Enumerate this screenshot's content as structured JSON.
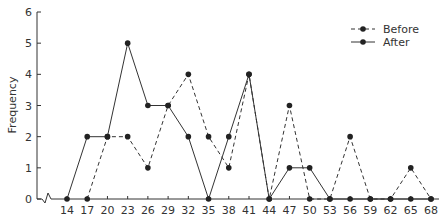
{
  "chart_data": {
    "type": "line",
    "title": "",
    "xlabel": "",
    "ylabel": "Frequency",
    "ylim": [
      0,
      6
    ],
    "yticks": [
      0,
      1,
      2,
      3,
      4,
      5,
      6
    ],
    "x": [
      14,
      17,
      20,
      23,
      26,
      29,
      32,
      35,
      38,
      41,
      44,
      47,
      50,
      53,
      56,
      59,
      62,
      65,
      68
    ],
    "axis_break": true,
    "grid": false,
    "legend_position": "top-right",
    "series": [
      {
        "name": "Before",
        "style": "dashed",
        "x": [
          17,
          20,
          23,
          26,
          29,
          32,
          35,
          38,
          41,
          44,
          47,
          50,
          53,
          56,
          59,
          62,
          65,
          68
        ],
        "values": [
          0,
          2,
          2,
          1,
          3,
          4,
          2,
          1,
          4,
          0,
          3,
          0,
          0,
          2,
          0,
          0,
          1,
          0
        ]
      },
      {
        "name": "After",
        "style": "solid",
        "x": [
          14,
          17,
          20,
          23,
          26,
          29,
          32,
          35,
          38,
          41,
          44,
          47,
          50,
          53,
          56,
          59,
          62,
          65,
          68
        ],
        "values": [
          0,
          2,
          2,
          5,
          3,
          3,
          2,
          0,
          2,
          4,
          0,
          1,
          1,
          0,
          0,
          0,
          0,
          0,
          0
        ]
      }
    ]
  },
  "colors": {
    "line": "#333333",
    "marker": "#222222"
  }
}
